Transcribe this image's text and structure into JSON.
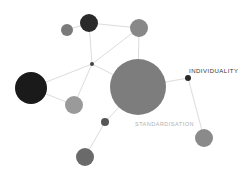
{
  "diagram": {
    "type": "network",
    "labels": {
      "individuality": "INDIVIDUALITY",
      "standardisation": "STANDARDISATION"
    },
    "colors": {
      "edge": "#dcdcdc",
      "dark": "#1e1e1e",
      "darkgray": "#333333",
      "mid": "#7a7a7a",
      "light": "#999999",
      "label_dark": "#333333",
      "label_light": "#b0b0b0"
    },
    "nodes": [
      {
        "id": "n1",
        "cx": 67,
        "cy": 30,
        "r": 6,
        "fill": "#7a7a7a"
      },
      {
        "id": "n2",
        "cx": 89,
        "cy": 23,
        "r": 9,
        "fill": "#2a2a2a"
      },
      {
        "id": "n3",
        "cx": 139,
        "cy": 28,
        "r": 9,
        "fill": "#888888"
      },
      {
        "id": "hub",
        "cx": 92,
        "cy": 64,
        "r": 2,
        "fill": "#444444"
      },
      {
        "id": "n5",
        "cx": 31,
        "cy": 88,
        "r": 16,
        "fill": "#1a1a1a"
      },
      {
        "id": "n6",
        "cx": 74,
        "cy": 105,
        "r": 9,
        "fill": "#9a9a9a"
      },
      {
        "id": "standardisation",
        "cx": 138,
        "cy": 87,
        "r": 28,
        "fill": "#7d7d7d"
      },
      {
        "id": "individuality",
        "cx": 188,
        "cy": 78,
        "r": 3,
        "fill": "#2a2a2a"
      },
      {
        "id": "n9",
        "cx": 105,
        "cy": 122,
        "r": 4,
        "fill": "#555555"
      },
      {
        "id": "n10",
        "cx": 204,
        "cy": 138,
        "r": 9,
        "fill": "#8a8a8a"
      },
      {
        "id": "n11",
        "cx": 85,
        "cy": 157,
        "r": 9,
        "fill": "#6a6a6a"
      }
    ],
    "edges": [
      {
        "x1": 67,
        "y1": 30,
        "x2": 89,
        "y2": 23
      },
      {
        "x1": 89,
        "y1": 23,
        "x2": 139,
        "y2": 28
      },
      {
        "x1": 89,
        "y1": 23,
        "x2": 92,
        "y2": 64
      },
      {
        "x1": 139,
        "y1": 28,
        "x2": 92,
        "y2": 64
      },
      {
        "x1": 139,
        "y1": 28,
        "x2": 138,
        "y2": 87
      },
      {
        "x1": 92,
        "y1": 64,
        "x2": 31,
        "y2": 88
      },
      {
        "x1": 92,
        "y1": 64,
        "x2": 74,
        "y2": 105
      },
      {
        "x1": 92,
        "y1": 64,
        "x2": 138,
        "y2": 87
      },
      {
        "x1": 31,
        "y1": 88,
        "x2": 74,
        "y2": 105
      },
      {
        "x1": 138,
        "y1": 87,
        "x2": 188,
        "y2": 78
      },
      {
        "x1": 188,
        "y1": 78,
        "x2": 204,
        "y2": 138
      },
      {
        "x1": 138,
        "y1": 87,
        "x2": 105,
        "y2": 122
      },
      {
        "x1": 105,
        "y1": 122,
        "x2": 85,
        "y2": 157
      }
    ]
  }
}
